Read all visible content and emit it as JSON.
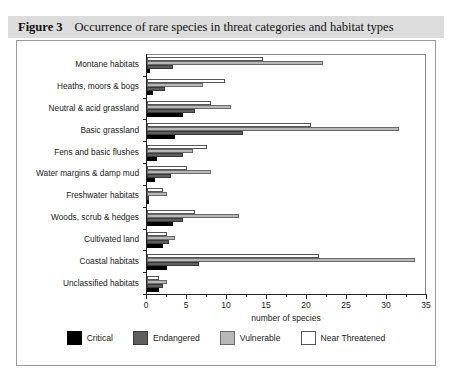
{
  "caption": {
    "number": "Figure 3",
    "text": "Occurrence of rare species in threat categories and habitat types"
  },
  "chart_data": {
    "type": "bar",
    "orientation": "horizontal",
    "title": "Occurrence of rare species in threat categories and habitat types",
    "xlabel": "number of species",
    "ylabel": "",
    "xlim": [
      0,
      35
    ],
    "xticks": [
      0,
      5,
      10,
      15,
      20,
      25,
      30,
      35
    ],
    "xtick_labels": [
      "0",
      "5",
      "10",
      "15",
      "20",
      "25",
      "30",
      "35"
    ],
    "minor_tick_interval": 2.5,
    "grid": false,
    "legend_position": "bottom",
    "categories": [
      "Montane habitats",
      "Heaths, moors & bogs",
      "Neutral & acid grassland",
      "Basic grassland",
      "Fens and basic flushes",
      "Water margins & damp mud",
      "Freshwater habitats",
      "Woods, scrub & hedges",
      "Cultivated land",
      "Coastal habitats",
      "Unclassified habitats"
    ],
    "series": [
      {
        "name": "Critical",
        "color": "#000000",
        "values": [
          0.4,
          0.8,
          4.5,
          3.5,
          1.2,
          1.0,
          0.2,
          3.2,
          2.0,
          2.5,
          1.5
        ]
      },
      {
        "name": "Endangered",
        "color": "#5e5e5e",
        "values": [
          3.3,
          2.2,
          6.0,
          12.0,
          4.5,
          3.0,
          0.3,
          4.5,
          2.8,
          6.5,
          2.0
        ]
      },
      {
        "name": "Vulnerable",
        "color": "#b8b8b8",
        "values": [
          22.0,
          7.0,
          10.5,
          31.5,
          5.8,
          8.0,
          2.5,
          11.5,
          3.5,
          33.5,
          2.5
        ]
      },
      {
        "name": "Near Threatened",
        "color": "#ffffff",
        "values": [
          14.5,
          9.8,
          8.0,
          20.5,
          7.5,
          5.0,
          2.0,
          6.0,
          2.5,
          21.5,
          1.5
        ]
      }
    ]
  },
  "legend": {
    "items": [
      {
        "label": "Critical",
        "swatch": "s-crit"
      },
      {
        "label": "Endangered",
        "swatch": "s-end"
      },
      {
        "label": "Vulnerable",
        "swatch": "s-vuln"
      },
      {
        "label": "Near Threatened",
        "swatch": "s-near"
      }
    ]
  }
}
